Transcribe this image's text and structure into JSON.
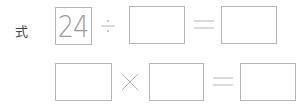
{
  "label": "式",
  "row1": {
    "box1_value": "24",
    "operator": "÷",
    "box2_value": "",
    "equals": "=",
    "box3_value": ""
  },
  "row2": {
    "box1_value": "",
    "operator": "×",
    "box2_value": "",
    "equals": "=",
    "box3_value": ""
  },
  "colors": {
    "line": "#b5b5b5",
    "text": "#9a9a9a"
  }
}
